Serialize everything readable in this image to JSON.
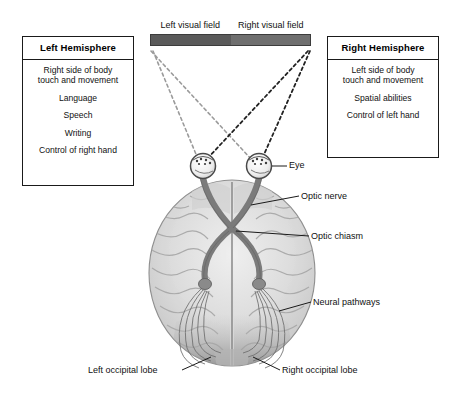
{
  "figure": {
    "background_color": "#ffffff"
  },
  "visual_field": {
    "left_label": "Left visual field",
    "right_label": "Right visual field",
    "left_color": "#5a5a5a",
    "right_color": "#6f6f6f",
    "border_color": "#3c3c3c"
  },
  "left_hemisphere": {
    "title": "Left Hemisphere",
    "items": [
      "Right side of body\ntouch and movement",
      "Language",
      "Speech",
      "Writing",
      "Control of right hand"
    ]
  },
  "right_hemisphere": {
    "title": "Right Hemisphere",
    "items": [
      "Left side of body\ntouch and movement",
      "Spatial abilities",
      "Control of left hand"
    ]
  },
  "callouts": {
    "eye": "Eye",
    "optic_nerve": "Optic nerve",
    "optic_chiasm": "Optic chiasm",
    "neural_pathways": "Neural pathways",
    "left_occipital_lobe": "Left occipital lobe",
    "right_occipital_lobe": "Right occipital lobe"
  },
  "anatomy": {
    "brain_fill": "#d8d8d8",
    "brain_outline": "#8f8f8f",
    "tract_color": "#7b7b7b",
    "tract_outline": "#5e5e5e",
    "occipital_shade": "#9a9a9a",
    "leader_line_color": "#1a1a1a",
    "projection_line_color": "#2b2b2b",
    "projection_line_color_light": "#9b9b9b"
  }
}
